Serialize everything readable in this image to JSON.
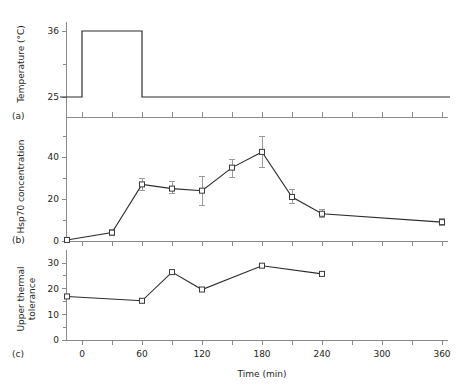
{
  "figure": {
    "panels": [
      {
        "id": "a",
        "label": "(a)",
        "ylabel": "Temperature (°C)"
      },
      {
        "id": "b",
        "label": "(b)",
        "ylabel": "Hsp70 concentration"
      },
      {
        "id": "c",
        "label": "(c)",
        "ylabel_line1": "Upper thermal",
        "ylabel_line2": "tolerance"
      }
    ],
    "xlabel": "Time (min)"
  },
  "chart_data": [
    {
      "type": "line",
      "panel": "a",
      "title": "",
      "xlabel": "Time (min)",
      "ylabel": "Temperature (°C)",
      "xlim": [
        -22,
        368
      ],
      "ylim": [
        23.5,
        37.5
      ],
      "yticks_major": [
        25,
        36
      ],
      "yticks_minor": [
        30.5
      ],
      "ytick_labels": [
        "25",
        "36"
      ],
      "xticks_major": [
        0,
        60,
        120,
        180,
        240,
        300,
        360
      ],
      "xticks_minor": [
        30,
        90,
        150,
        210,
        270,
        330
      ],
      "grid": false,
      "legend": "none",
      "description": "Step heat-shock profile: 25 C baseline, raised to 36 C from 0 to 60 min, then returned to 25 C.",
      "x": [
        -22,
        0,
        0,
        60,
        60,
        368
      ],
      "values": [
        25,
        25,
        36,
        36,
        25,
        25
      ]
    },
    {
      "type": "line",
      "panel": "b",
      "title": "",
      "xlabel": "Time (min)",
      "ylabel": "Hsp70 concentration",
      "xlim": [
        -22,
        368
      ],
      "ylim": [
        0,
        52
      ],
      "yticks_major": [
        0,
        20,
        40
      ],
      "yticks_minor": [
        10,
        30,
        50
      ],
      "ytick_labels": [
        "0",
        "20",
        "40"
      ],
      "xticks_major": [
        0,
        60,
        120,
        180,
        240,
        300,
        360
      ],
      "xticks_minor": [
        30,
        90,
        150,
        210,
        270,
        330
      ],
      "grid": false,
      "legend": "none",
      "markers": "open-square",
      "errorbars": true,
      "x": [
        -15,
        30,
        60,
        90,
        120,
        150,
        180,
        210,
        240,
        360
      ],
      "values": [
        0.5,
        4,
        27,
        25,
        24,
        35,
        42.5,
        21,
        13,
        9
      ],
      "err_low": [
        0.5,
        1.5,
        3,
        2.5,
        7,
        4.5,
        7.5,
        3,
        2,
        1.5
      ],
      "err_high": [
        0.5,
        1.5,
        3,
        3.5,
        7,
        4,
        7.5,
        3.5,
        2,
        1.5
      ]
    },
    {
      "type": "line",
      "panel": "c",
      "title": "",
      "xlabel": "Time (min)",
      "ylabel": "Upper thermal tolerance",
      "xlim": [
        -22,
        368
      ],
      "ylim": [
        0,
        32
      ],
      "yticks_major": [
        0,
        10,
        20,
        30
      ],
      "yticks_minor": [
        5,
        15,
        25
      ],
      "ytick_labels": [
        "0",
        "10",
        "20",
        "30"
      ],
      "xticks_major": [
        0,
        60,
        120,
        180,
        240,
        300,
        360
      ],
      "xticks_minor": [
        30,
        90,
        150,
        210,
        270,
        330
      ],
      "grid": false,
      "legend": "none",
      "markers": "open-square",
      "errorbars": false,
      "x": [
        -15,
        60,
        90,
        120,
        180,
        240
      ],
      "values": [
        17,
        15.3,
        26.5,
        19.7,
        29,
        25.8
      ]
    }
  ],
  "xaxis": {
    "label": "Time (min)",
    "tick_labels": [
      "0",
      "60",
      "120",
      "180",
      "240",
      "300",
      "360"
    ],
    "tick_values": [
      0,
      60,
      120,
      180,
      240,
      300,
      360
    ]
  },
  "colors": {
    "line": "#2b2b2b",
    "axis": "#8a8a8a",
    "marker_fill": "#ffffff",
    "marker_stroke": "#3a3a3a",
    "error": "#9a9a9a",
    "text": "#231f20",
    "background": "#ffffff"
  }
}
